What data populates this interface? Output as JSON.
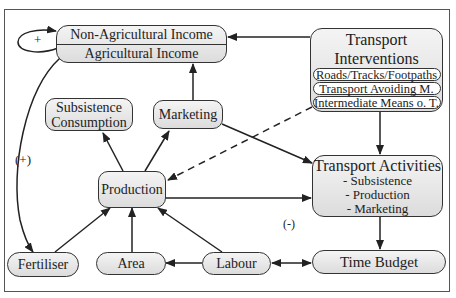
{
  "diagram": {
    "nodes": {
      "income": {
        "non_agricultural": "Non-Agricultural Income",
        "agricultural": "Agricultural Income"
      },
      "transport_interventions": {
        "title_line1": "Transport",
        "title_line2": "Interventions",
        "items": [
          "Roads/Tracks/Footpaths",
          "Transport Avoiding M.",
          "Intermediate Means o. T."
        ]
      },
      "subsistence_consumption": {
        "line1": "Subsistence",
        "line2": "Consumption"
      },
      "marketing": "Marketing",
      "production": "Production",
      "transport_activities": {
        "title": "Transport Activities",
        "items": [
          "- Subsistence",
          "- Production",
          "- Marketing"
        ]
      },
      "fertiliser": "Fertiliser",
      "area": "Area",
      "labour": "Labour",
      "time_budget": "Time Budget"
    },
    "labels": {
      "self_loop": "+",
      "income_to_fertiliser": "(+)",
      "negative_effect": "(-)"
    },
    "edges": [
      {
        "from": "Transport Interventions",
        "to": "Income",
        "style": "solid"
      },
      {
        "from": "Income",
        "to": "Income",
        "style": "solid",
        "label": "+"
      },
      {
        "from": "Marketing",
        "to": "Agricultural Income",
        "style": "solid"
      },
      {
        "from": "Income",
        "to": "Fertiliser",
        "style": "solid",
        "label": "(+)"
      },
      {
        "from": "Production",
        "to": "Subsistence Consumption",
        "style": "solid"
      },
      {
        "from": "Production",
        "to": "Marketing",
        "style": "solid"
      },
      {
        "from": "Transport Interventions",
        "to": "Production",
        "style": "dashed"
      },
      {
        "from": "Transport Interventions",
        "to": "Transport Activities",
        "style": "solid"
      },
      {
        "from": "Marketing",
        "to": "Transport Activities",
        "style": "solid"
      },
      {
        "from": "Production",
        "to": "Transport Activities",
        "style": "solid"
      },
      {
        "from": "Transport Activities",
        "to": "Time Budget",
        "style": "solid",
        "label": "(-)"
      },
      {
        "from": "Fertiliser",
        "to": "Production",
        "style": "solid"
      },
      {
        "from": "Area",
        "to": "Production",
        "style": "solid"
      },
      {
        "from": "Labour",
        "to": "Production",
        "style": "solid"
      },
      {
        "from": "Labour",
        "to": "Area",
        "style": "solid"
      },
      {
        "from": "Labour",
        "to": "Time Budget",
        "style": "solid",
        "bidirectional": true
      }
    ]
  }
}
